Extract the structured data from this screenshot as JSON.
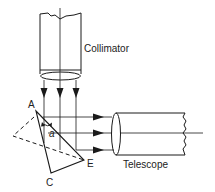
{
  "diagram": {
    "labels": {
      "collimator": "Collimator",
      "telescope": "Telescope",
      "vertex_a": "A",
      "vertex_c": "C",
      "vertex_e": "E",
      "angle": "a"
    },
    "colors": {
      "stroke": "#1a1a1a",
      "background": "#ffffff"
    }
  }
}
